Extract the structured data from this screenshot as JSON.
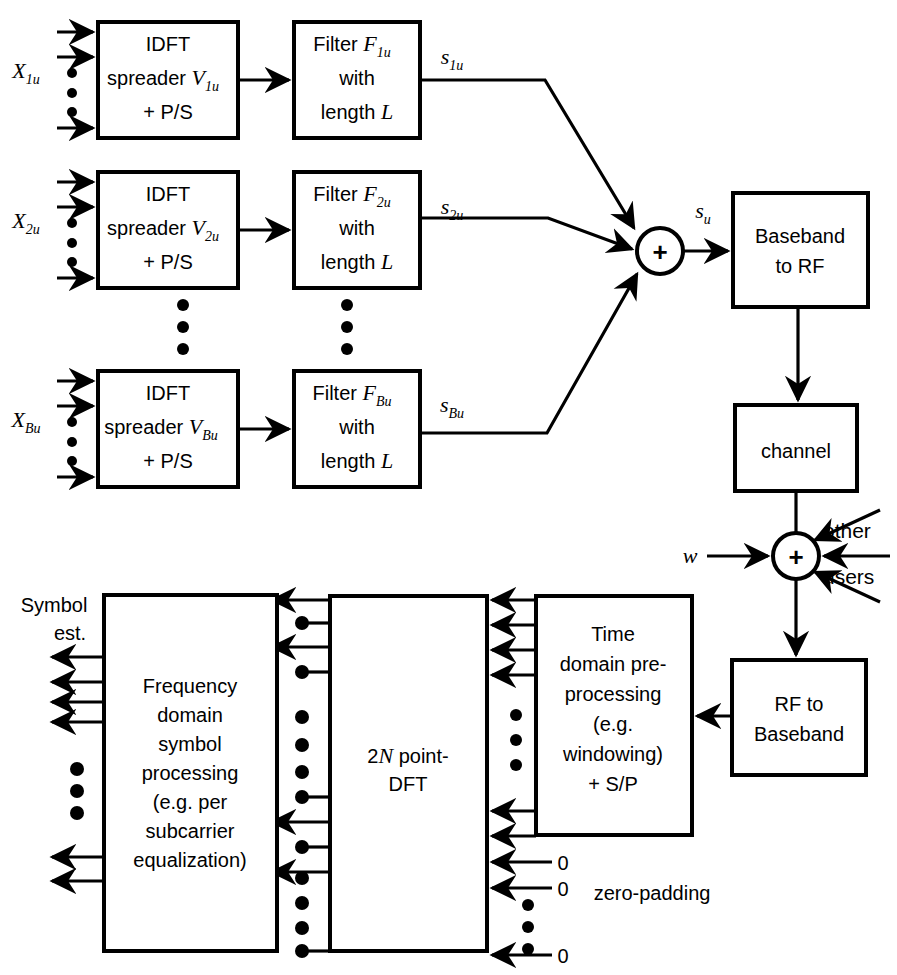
{
  "figure": {
    "type": "block-diagram",
    "background_color": "#ffffff",
    "line_color": "#000000"
  },
  "transmitter": {
    "branches": [
      {
        "input_label": "X",
        "input_sub": "1u",
        "spreader_line1": "IDFT",
        "spreader_line2": "spreader",
        "spreader_sym": "V",
        "spreader_sub": "1u",
        "spreader_line3": "+ P/S",
        "filter_line1": "Filter",
        "filter_sym": "F",
        "filter_sub": "1u",
        "filter_line2": "with",
        "filter_line3a": "length",
        "filter_line3b": "L",
        "output_sym": "s",
        "output_sub": "1u"
      },
      {
        "input_label": "X",
        "input_sub": "2u",
        "spreader_line1": "IDFT",
        "spreader_line2": "spreader",
        "spreader_sym": "V",
        "spreader_sub": "2u",
        "spreader_line3": "+ P/S",
        "filter_line1": "Filter",
        "filter_sym": "F",
        "filter_sub": "2u",
        "filter_line2": "with",
        "filter_line3a": "length",
        "filter_line3b": "L",
        "output_sym": "s",
        "output_sub": "2u"
      },
      {
        "input_label": "X",
        "input_sub": "Bu",
        "spreader_line1": "IDFT",
        "spreader_line2": "spreader",
        "spreader_sym": "V",
        "spreader_sub": "Bu",
        "spreader_line3": "+ P/S",
        "filter_line1": "Filter",
        "filter_sym": "F",
        "filter_sub": "Bu",
        "filter_line2": "with",
        "filter_line3a": "length",
        "filter_line3b": "L",
        "output_sym": "s",
        "output_sub": "Bu"
      }
    ],
    "summer_symbol": "+",
    "sum_output_sym": "s",
    "sum_output_sub": "u"
  },
  "rf_chain": {
    "baseband_to_rf_line1": "Baseband",
    "baseband_to_rf_line2": "to RF",
    "channel_label": "channel",
    "noise_summer_symbol": "+",
    "noise_label": "w",
    "other_label": "other",
    "users_label": "users",
    "rf_to_baseband_line1": "RF to",
    "rf_to_baseband_line2": "Baseband"
  },
  "receiver": {
    "time_domain_lines": [
      "Time",
      "domain pre-",
      "processing",
      "(e.g.",
      "windowing)",
      "+ S/P"
    ],
    "dft_line1a": "2",
    "dft_line1b": "N",
    "dft_line1c": " point-",
    "dft_line2": "DFT",
    "freq_domain_lines": [
      "Frequency",
      "domain",
      "symbol",
      "processing",
      "(e.g. per",
      "subcarrier",
      "equalization)"
    ],
    "symbol_est_line1": "Symbol",
    "symbol_est_line2": "est.",
    "zero_labels": [
      "0",
      "0",
      "0"
    ],
    "zero_padding_label": "zero-padding"
  }
}
